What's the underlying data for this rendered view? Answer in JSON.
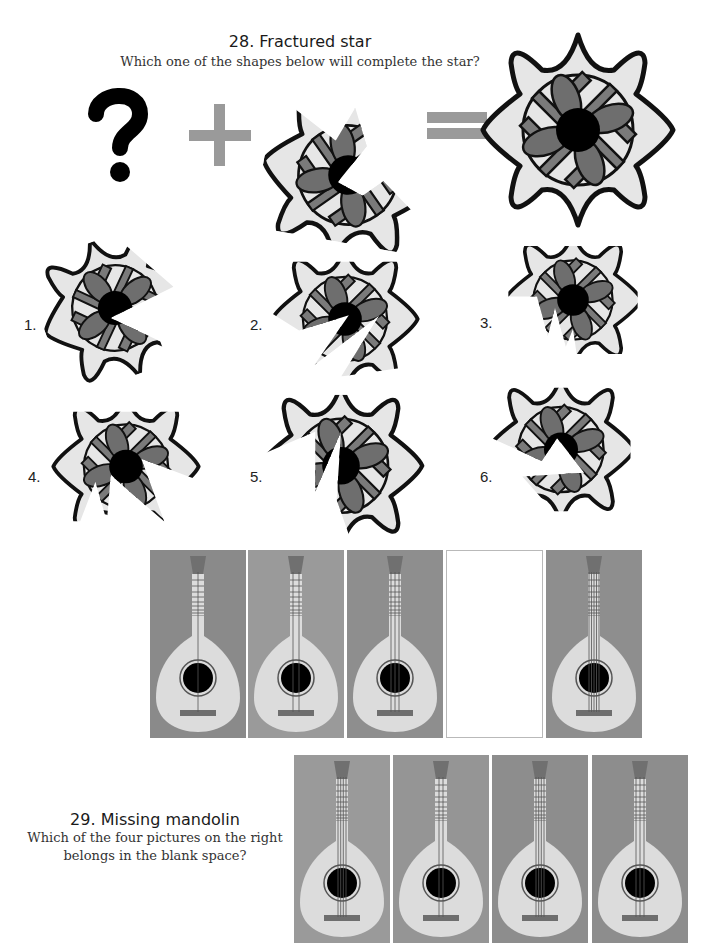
{
  "puzzle28": {
    "title": "28. Fractured star",
    "question": "Which one of the shapes below will complete the star?",
    "equation": {
      "unknown_symbol": "?",
      "plus_symbol": "+",
      "equals_symbol": "=",
      "given_piece": "partial fractured star",
      "result": "complete eight-pointed star"
    },
    "options": [
      {
        "label": "1."
      },
      {
        "label": "2."
      },
      {
        "label": "3."
      },
      {
        "label": "4."
      },
      {
        "label": "5."
      },
      {
        "label": "6."
      }
    ],
    "colors": {
      "outline": "#111111",
      "light_fill": "#e6e6e6",
      "mid_fill": "#7a7a7a",
      "dark_fill": "#000000",
      "symbol_gray": "#9a9a9a"
    }
  },
  "puzzle29": {
    "title": "29. Missing mandolin",
    "question_line1": "Which of the four pictures on the right",
    "question_line2": "belongs in the blank space?",
    "sequence": [
      {
        "strings": 1,
        "bg": "#8a8a8a"
      },
      {
        "strings": 2,
        "bg": "#9a9a9a"
      },
      {
        "strings": 3,
        "bg": "#8e8e8e"
      },
      {
        "blank": true
      },
      {
        "strings": 5,
        "bg": "#8e8e8e"
      }
    ],
    "choices": [
      {
        "strings": 4,
        "bg": "#9a9a9a"
      },
      {
        "strings": 2,
        "bg": "#959595"
      },
      {
        "strings": 4,
        "bg": "#8d8d8d"
      },
      {
        "strings": 3,
        "bg": "#8d8d8d"
      }
    ],
    "colors": {
      "body": "#dcdcdc",
      "hole": "#000000",
      "bridge": "#6e6e6e",
      "headstock": "#707070"
    }
  }
}
